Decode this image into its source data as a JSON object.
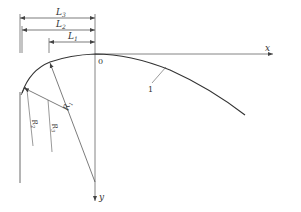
{
  "diagram": {
    "type": "geometric-curve-with-dimensions",
    "axes": {
      "x_label": "x",
      "y_label": "y",
      "origin_label": "0"
    },
    "dimensions": [
      {
        "name": "L3",
        "label_main": "L",
        "label_sub": "3"
      },
      {
        "name": "L2",
        "label_main": "L",
        "label_sub": "2"
      },
      {
        "name": "L1",
        "label_main": "L",
        "label_sub": "1"
      }
    ],
    "radii": [
      {
        "name": "R1",
        "label_main": "R",
        "label_sub": "1"
      },
      {
        "name": "R2",
        "label_main": "R",
        "label_sub": "2"
      },
      {
        "name": "R3",
        "label_main": "R",
        "label_sub": "3"
      }
    ],
    "curve_label": "1",
    "colors": {
      "line": "#444444",
      "axis": "#666666",
      "text": "#333333"
    }
  }
}
